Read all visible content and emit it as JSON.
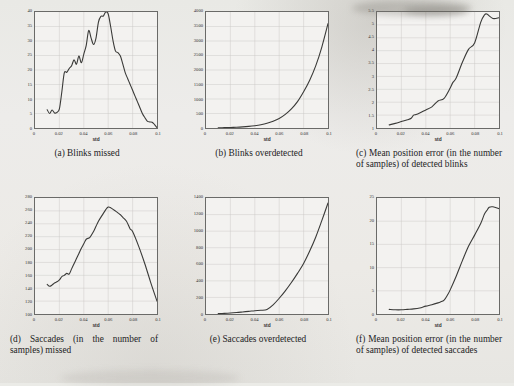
{
  "figure": {
    "background_color": "#ebebe7",
    "curve_color": "#3a3a38",
    "axis_color": "#6a6a68",
    "grid_color": "#c9c8c5"
  },
  "captions": {
    "a": "(a) Blinks missed",
    "b": "(b) Blinks overdetected",
    "c": "(c) Mean position error (in the number of samples) of detected blinks",
    "d": "(d) Saccades (in the number of samples) missed",
    "e": "(e) Saccades overdetected",
    "f": "(f) Mean position error (in the number of samples) of detected saccades"
  },
  "chart_data": [
    {
      "id": "a",
      "type": "line",
      "title": "(a) Blinks missed",
      "xlabel": "std",
      "ylabel": "",
      "xlim": [
        0,
        0.1
      ],
      "ylim": [
        0,
        40
      ],
      "xticks": [
        0,
        0.02,
        0.04,
        0.06,
        0.08,
        0.1
      ],
      "xticklabels": [
        "0",
        "0.02",
        "0.04",
        "0.06",
        "0.08",
        "0.1"
      ],
      "yticks": [
        0,
        5,
        10,
        15,
        20,
        25,
        30,
        35,
        40
      ],
      "yticklabels": [
        "0",
        "5",
        "10",
        "15",
        "20",
        "25",
        "30",
        "35",
        "40"
      ],
      "grid": true,
      "legend": "none",
      "x": [
        0.01,
        0.012,
        0.014,
        0.016,
        0.018,
        0.02,
        0.022,
        0.024,
        0.026,
        0.028,
        0.03,
        0.032,
        0.034,
        0.036,
        0.038,
        0.04,
        0.042,
        0.044,
        0.046,
        0.048,
        0.05,
        0.052,
        0.054,
        0.056,
        0.058,
        0.06,
        0.062,
        0.064,
        0.066,
        0.068,
        0.07,
        0.072,
        0.074,
        0.076,
        0.078,
        0.08,
        0.082,
        0.084,
        0.086,
        0.088,
        0.09,
        0.092,
        0.094,
        0.096,
        0.098,
        0.1
      ],
      "y": [
        6.3,
        5.0,
        6.2,
        5.2,
        5.4,
        6.6,
        12.5,
        19.0,
        19.2,
        20.5,
        21.5,
        23.5,
        22.0,
        24.8,
        22.5,
        25.5,
        28.5,
        33.6,
        31.0,
        28.8,
        31.0,
        36.5,
        38.5,
        38.6,
        40.0,
        39.3,
        35.0,
        30.0,
        26.5,
        26.0,
        24.8,
        22.0,
        19.0,
        17.0,
        15.0,
        13.0,
        11.0,
        9.0,
        7.0,
        5.0,
        3.6,
        2.4,
        2.1,
        2.0,
        1.2,
        0.1
      ]
    },
    {
      "id": "b",
      "type": "line",
      "title": "(b) Blinks overdetected",
      "xlabel": "std",
      "ylabel": "",
      "xlim": [
        0,
        0.1
      ],
      "ylim": [
        0,
        4000
      ],
      "xticks": [
        0,
        0.02,
        0.04,
        0.06,
        0.08,
        0.1
      ],
      "xticklabels": [
        "0",
        "0.02",
        "0.04",
        "0.06",
        "0.08",
        "0.1"
      ],
      "yticks": [
        0,
        500,
        1000,
        1500,
        2000,
        2500,
        3000,
        3500,
        4000
      ],
      "yticklabels": [
        "0",
        "500",
        "1000",
        "1500",
        "2000",
        "2500",
        "3000",
        "3500",
        "4000"
      ],
      "grid": true,
      "legend": "none",
      "x": [
        0.01,
        0.015,
        0.02,
        0.025,
        0.03,
        0.035,
        0.04,
        0.045,
        0.05,
        0.055,
        0.06,
        0.065,
        0.07,
        0.075,
        0.08,
        0.085,
        0.09,
        0.095,
        0.1
      ],
      "y": [
        8,
        12,
        18,
        26,
        38,
        55,
        80,
        115,
        165,
        235,
        330,
        470,
        660,
        910,
        1250,
        1650,
        2150,
        2800,
        3600
      ]
    },
    {
      "id": "c",
      "type": "line",
      "title": "(c) Mean position error (in the number of samples) of detected blinks",
      "xlabel": "std",
      "ylabel": "",
      "xlim": [
        0,
        0.1
      ],
      "ylim": [
        1,
        5.5
      ],
      "xticks": [
        0,
        0.02,
        0.04,
        0.06,
        0.08,
        0.1
      ],
      "xticklabels": [
        "0",
        "0.02",
        "0.04",
        "0.06",
        "0.08",
        "0.1"
      ],
      "yticks": [
        1,
        1.5,
        2,
        2.5,
        3,
        3.5,
        4,
        4.5,
        5,
        5.5
      ],
      "yticklabels": [
        "1",
        "1.5",
        "2",
        "2.5",
        "3",
        "3.5",
        "4",
        "4.5",
        "5",
        "5.5"
      ],
      "grid": true,
      "legend": "none",
      "x": [
        0.01,
        0.015,
        0.02,
        0.025,
        0.028,
        0.03,
        0.032,
        0.035,
        0.04,
        0.045,
        0.05,
        0.055,
        0.06,
        0.062,
        0.065,
        0.07,
        0.075,
        0.08,
        0.085,
        0.088,
        0.09,
        0.095,
        0.1
      ],
      "y": [
        1.12,
        1.18,
        1.25,
        1.32,
        1.38,
        1.5,
        1.52,
        1.58,
        1.7,
        1.82,
        2.05,
        2.15,
        2.55,
        2.75,
        2.95,
        3.55,
        4.05,
        4.3,
        5.1,
        5.38,
        5.42,
        5.25,
        5.28
      ]
    },
    {
      "id": "d",
      "type": "line",
      "title": "(d) Saccades (in the number of samples) missed",
      "xlabel": "std",
      "ylabel": "",
      "xlim": [
        0,
        0.1
      ],
      "ylim": [
        100,
        280
      ],
      "xticks": [
        0,
        0.02,
        0.04,
        0.06,
        0.08,
        0.1
      ],
      "xticklabels": [
        "0",
        "0.02",
        "0.04",
        "0.06",
        "0.08",
        "0.1"
      ],
      "yticks": [
        100,
        120,
        140,
        160,
        180,
        200,
        220,
        240,
        260,
        280
      ],
      "yticklabels": [
        "100",
        "120",
        "140",
        "160",
        "180",
        "200",
        "220",
        "240",
        "260",
        "280"
      ],
      "grid": true,
      "legend": "none",
      "x": [
        0.01,
        0.012,
        0.014,
        0.016,
        0.018,
        0.02,
        0.022,
        0.024,
        0.026,
        0.028,
        0.03,
        0.032,
        0.034,
        0.036,
        0.038,
        0.04,
        0.042,
        0.045,
        0.048,
        0.05,
        0.052,
        0.055,
        0.058,
        0.06,
        0.062,
        0.065,
        0.068,
        0.07,
        0.072,
        0.075,
        0.078,
        0.08,
        0.085,
        0.09,
        0.095,
        0.1
      ],
      "y": [
        146,
        143,
        145,
        148,
        150,
        153,
        158,
        160,
        163,
        162,
        170,
        178,
        186,
        194,
        202,
        209,
        216,
        219,
        228,
        236,
        244,
        253,
        262,
        266,
        265,
        261,
        257,
        254,
        250,
        244,
        232,
        228,
        205,
        178,
        148,
        120
      ]
    },
    {
      "id": "e",
      "type": "line",
      "title": "(e) Saccades overdetected",
      "xlabel": "std",
      "ylabel": "",
      "xlim": [
        0,
        0.1
      ],
      "ylim": [
        0,
        1400
      ],
      "xticks": [
        0,
        0.02,
        0.04,
        0.06,
        0.08,
        0.1
      ],
      "xticklabels": [
        "0",
        "0.02",
        "0.04",
        "0.06",
        "0.08",
        "0.1"
      ],
      "yticks": [
        0,
        200,
        400,
        600,
        800,
        1000,
        1200,
        1400
      ],
      "yticklabels": [
        "0",
        "200",
        "400",
        "600",
        "800",
        "1000",
        "1200",
        "1400"
      ],
      "grid": true,
      "legend": "none",
      "x": [
        0.01,
        0.015,
        0.02,
        0.025,
        0.03,
        0.035,
        0.04,
        0.045,
        0.05,
        0.055,
        0.06,
        0.065,
        0.07,
        0.075,
        0.08,
        0.085,
        0.09,
        0.095,
        0.1
      ],
      "y": [
        5,
        8,
        12,
        18,
        25,
        32,
        40,
        45,
        55,
        110,
        190,
        280,
        380,
        490,
        610,
        760,
        930,
        1130,
        1340
      ]
    },
    {
      "id": "f",
      "type": "line",
      "title": "(f) Mean position error (in the number of samples) of detected saccades",
      "xlabel": "std",
      "ylabel": "",
      "xlim": [
        0,
        0.1
      ],
      "ylim": [
        0,
        25
      ],
      "xticks": [
        0,
        0.02,
        0.04,
        0.06,
        0.08,
        0.1
      ],
      "xticklabels": [
        "0",
        "0.02",
        "0.04",
        "0.06",
        "0.08",
        "0.1"
      ],
      "yticks": [
        0,
        5,
        10,
        15,
        20,
        25
      ],
      "yticklabels": [
        "0",
        "5",
        "10",
        "15",
        "20",
        "25"
      ],
      "grid": true,
      "legend": "none",
      "x": [
        0.01,
        0.015,
        0.02,
        0.025,
        0.03,
        0.035,
        0.04,
        0.045,
        0.05,
        0.052,
        0.055,
        0.058,
        0.06,
        0.065,
        0.07,
        0.075,
        0.08,
        0.085,
        0.088,
        0.09,
        0.092,
        0.095,
        0.1
      ],
      "y": [
        1.0,
        0.9,
        0.9,
        1.0,
        1.1,
        1.3,
        1.7,
        2.0,
        2.4,
        2.6,
        3.0,
        4.2,
        5.2,
        8.2,
        11.5,
        14.6,
        17.0,
        19.5,
        21.5,
        22.3,
        23.0,
        23.1,
        22.7
      ]
    }
  ]
}
